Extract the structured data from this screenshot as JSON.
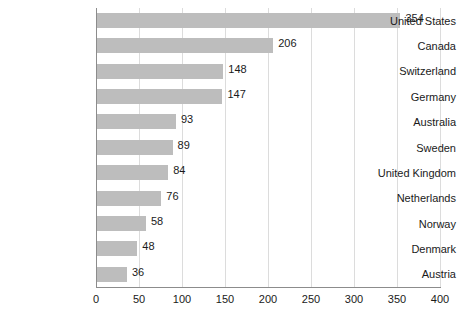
{
  "chart_data": {
    "type": "bar",
    "orientation": "horizontal",
    "title": "",
    "subtitle": "",
    "xlabel": "",
    "ylabel": "",
    "xlim": [
      0,
      400
    ],
    "xticks": [
      0,
      50,
      100,
      150,
      200,
      250,
      300,
      350,
      400
    ],
    "grid": true,
    "legend": false,
    "legend_position": "none",
    "show_data_labels": true,
    "categories": [
      "United States",
      "Canada",
      "Switzerland",
      "Germany",
      "Australia",
      "Sweden",
      "United Kingdom",
      "Netherlands",
      "Norway",
      "Denmark",
      "Austria"
    ],
    "values": [
      354,
      206,
      148,
      147,
      93,
      89,
      84,
      76,
      58,
      48,
      36
    ],
    "value_labels": [
      "354",
      "206",
      "148",
      "147",
      "93",
      "89",
      "84",
      "76",
      "58",
      "48",
      "36"
    ],
    "tick_labels": [
      "0",
      "50",
      "100",
      "150",
      "200",
      "250",
      "300",
      "350",
      "400"
    ]
  },
  "style": {
    "bar_color": "#bdbdbd",
    "grid_color": "#dcdcdc",
    "axis_color": "#8c8c8c",
    "text_color": "#1a1a1a",
    "background": "#ffffff"
  }
}
